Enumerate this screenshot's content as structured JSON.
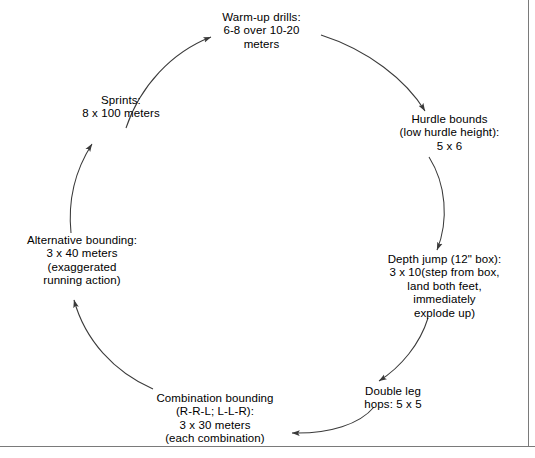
{
  "diagram": {
    "type": "cycle-flow",
    "title_present": false,
    "direction": "clockwise",
    "colors": {
      "text": "#000000",
      "arrow": "#3a3a3a",
      "frame": "#7a7a7a",
      "background": "#ffffff"
    },
    "nodes": [
      {
        "id": "warm-up-drills",
        "lines": [
          "Warm-up drills:",
          "6-8 over 10-20",
          "meters"
        ]
      },
      {
        "id": "hurdle-bounds",
        "lines": [
          "Hurdle bounds",
          "(low hurdle height):",
          "5 x 6"
        ]
      },
      {
        "id": "depth-jump",
        "lines": [
          "Depth jump (12\" box):",
          "3 x 10(step from box,",
          "land both feet,",
          "immediately",
          "explode up)"
        ]
      },
      {
        "id": "double-leg-hops",
        "lines": [
          "Double leg",
          "hops: 5 x 5"
        ]
      },
      {
        "id": "combination-bounding",
        "lines": [
          "Combination bounding",
          "(R-R-L; L-L-R):",
          "3 x 30 meters",
          "(each combination)"
        ]
      },
      {
        "id": "alternative-bounding",
        "lines": [
          "Alternative bounding:",
          "3 x 40 meters",
          "(exaggerated",
          "running action)"
        ]
      },
      {
        "id": "sprints",
        "lines": [
          "Sprints:",
          "8 x 100 meters"
        ]
      }
    ],
    "edges": [
      {
        "from": "warm-up-drills",
        "to": "hurdle-bounds"
      },
      {
        "from": "hurdle-bounds",
        "to": "depth-jump"
      },
      {
        "from": "depth-jump",
        "to": "double-leg-hops"
      },
      {
        "from": "double-leg-hops",
        "to": "combination-bounding"
      },
      {
        "from": "combination-bounding",
        "to": "alternative-bounding"
      },
      {
        "from": "alternative-bounding",
        "to": "sprints"
      },
      {
        "from": "sprints",
        "to": "warm-up-drills"
      }
    ]
  }
}
